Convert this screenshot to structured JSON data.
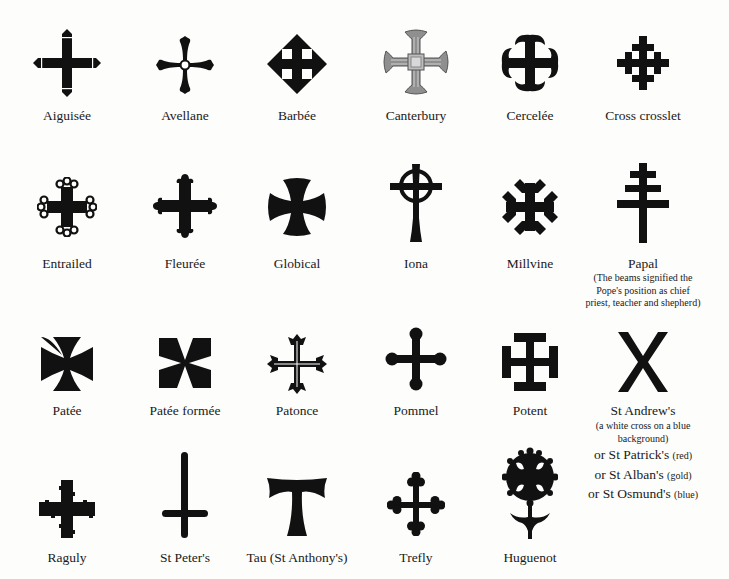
{
  "page": {
    "background": "#fdfdfc",
    "ink": "#111111",
    "canterbury_grey": "#8a8a8a"
  },
  "crosses": [
    {
      "name": "Aiguisée",
      "icon": "aiguisee-cross-icon"
    },
    {
      "name": "Avellane",
      "icon": "avellane-cross-icon"
    },
    {
      "name": "Barbée",
      "icon": "barbee-cross-icon"
    },
    {
      "name": "Canterbury",
      "icon": "canterbury-cross-icon"
    },
    {
      "name": "Cercelée",
      "icon": "cercelee-cross-icon"
    },
    {
      "name": "Cross crosslet",
      "icon": "cross-crosslet-icon"
    },
    {
      "name": "Entrailed",
      "icon": "entrailed-cross-icon"
    },
    {
      "name": "Fleurée",
      "icon": "fleuree-cross-icon"
    },
    {
      "name": "Globical",
      "icon": "globical-cross-icon"
    },
    {
      "name": "Iona",
      "icon": "iona-cross-icon"
    },
    {
      "name": "Millvine",
      "icon": "millvine-cross-icon"
    },
    {
      "name": "Papal",
      "icon": "papal-cross-icon",
      "description": [
        "(The beams signified the",
        "Pope's position as chief",
        "priest, teacher and shepherd)"
      ]
    },
    {
      "name": "Patée",
      "icon": "patee-cross-icon"
    },
    {
      "name": "Patée formée",
      "icon": "patee-formee-cross-icon"
    },
    {
      "name": "Patonce",
      "icon": "patonce-cross-icon"
    },
    {
      "name": "Pommel",
      "icon": "pommel-cross-icon"
    },
    {
      "name": "Potent",
      "icon": "potent-cross-icon"
    },
    {
      "name": "St Andrew's",
      "icon": "st-andrews-cross-icon",
      "description": [
        "(a white cross on a blue",
        "background)"
      ],
      "alternatives": [
        {
          "name": "or St Patrick's",
          "note": "(red)"
        },
        {
          "name": "or St Alban's",
          "note": "(gold)"
        },
        {
          "name": "or St Osmund's",
          "note": "(blue)"
        }
      ]
    },
    {
      "name": "Raguly",
      "icon": "raguly-cross-icon"
    },
    {
      "name": "St Peter's",
      "icon": "st-peters-cross-icon"
    },
    {
      "name": "Tau (St Anthony's)",
      "icon": "tau-cross-icon"
    },
    {
      "name": "Trefly",
      "icon": "trefly-cross-icon"
    },
    {
      "name": "Huguenot",
      "icon": "huguenot-cross-icon"
    }
  ]
}
